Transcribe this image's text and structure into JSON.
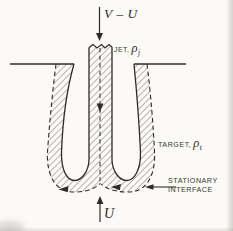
{
  "figure": {
    "labels": {
      "top_velocity": "V – U",
      "jet_prefix": "JET, ",
      "jet_symbol": "ρ",
      "jet_subscript": "j",
      "target_prefix": "TARGET, ",
      "target_symbol": "ρ",
      "target_subscript": "t",
      "interface_line1": "STATIONARY",
      "interface_line2": "INTERFACE",
      "bottom_velocity": "U"
    },
    "colors": {
      "ink": "#2f2c27",
      "background": "#fbfaf6"
    }
  }
}
